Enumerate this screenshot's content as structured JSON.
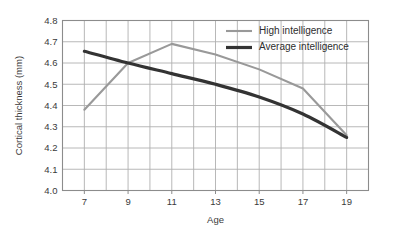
{
  "chart_data": {
    "type": "line",
    "title": "",
    "subtitle": "",
    "xlabel": "Age",
    "ylabel": "Cortical thickness (mm)",
    "x": [
      7,
      9,
      11,
      13,
      15,
      17,
      19
    ],
    "xtick_labels": [
      "7",
      "9",
      "11",
      "13",
      "15",
      "17",
      "19"
    ],
    "ytick_labels": [
      "4.0",
      "4.1",
      "4.2",
      "4.3",
      "4.4",
      "4.5",
      "4.6",
      "4.7",
      "4.8"
    ],
    "ytick_values": [
      4.0,
      4.1,
      4.2,
      4.3,
      4.4,
      4.5,
      4.6,
      4.7,
      4.8
    ],
    "xlim": [
      6,
      20
    ],
    "ylim": [
      4.0,
      4.8
    ],
    "grid": true,
    "grid_color": "#b0b0b0",
    "frame_color": "#8c8c8c",
    "legend_position": "top-right",
    "series": [
      {
        "name": "High intelligence",
        "color": "#999999",
        "width": 2.1,
        "values": [
          4.38,
          4.6,
          4.69,
          4.64,
          4.57,
          4.48,
          4.26
        ]
      },
      {
        "name": "Average intelligence",
        "color": "#333333",
        "width": 3.2,
        "values": [
          4.655,
          4.6,
          4.55,
          4.5,
          4.44,
          4.36,
          4.25
        ]
      }
    ]
  },
  "legend": {
    "entries": [
      {
        "label": "High intelligence",
        "color": "#999999",
        "width": 2.1
      },
      {
        "label": "Average intelligence",
        "color": "#333333",
        "width": 3.2
      }
    ]
  },
  "axes": {
    "x_title": "Age",
    "y_title": "Cortical thickness (mm)"
  }
}
